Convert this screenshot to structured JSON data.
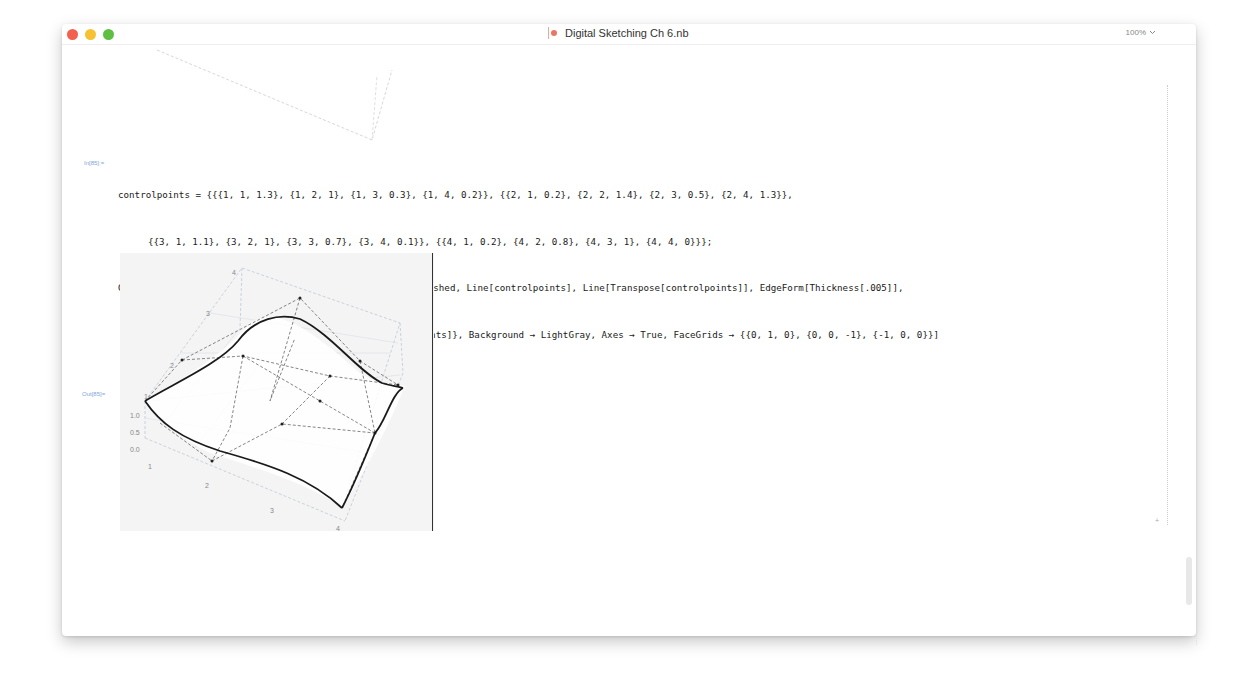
{
  "window": {
    "title": "Digital Sketching Ch 6.nb",
    "zoom_level": "100%",
    "traffic_lights": [
      "close",
      "minimize",
      "maximize"
    ],
    "colors": {
      "close": "#f3604f",
      "minimize": "#f6c232",
      "maximize": "#5fbf43",
      "cell_label": "#7fa6d6"
    }
  },
  "input_cell": {
    "label": "In[85]:=",
    "lines": [
      "controlpoints = {{{1, 1, 1.3}, {1, 2, 1}, {1, 3, 0.3}, {1, 4, 0.2}}, {{2, 1, 0.2}, {2, 2, 1.4}, {2, 3, 0.5}, {2, 4, 1.3}},",
      "{{3, 1, 1.1}, {3, 2, 1}, {3, 3, 0.7}, {3, 4, 0.1}}, {{4, 1, 0.2}, {4, 2, 0.8}, {4, 3, 1}, {4, 4, 0}}};",
      "Graphics3D[{PointSize[.01], Map[Point, controlpoints], Dashed, Line[controlpoints], Line[Transpose[controlpoints]], EdgeForm[Thickness[.005]],",
      "Glow[White], Opacity[.5], BSplineSurface[controlpoints]}, Background → LightGray, Axes → True, FaceGrids → {{0, 1, 0}, {0, 0, -1}, {-1, 0, 0}}]"
    ]
  },
  "output_cell": {
    "label": "Out[85]=",
    "plot": {
      "type": "Graphics3D BSplineSurface",
      "background": "#f4f4f4",
      "z_axis_ticks": [
        "1.0",
        "0.5",
        "0.0"
      ],
      "x_axis_ticks": [
        "1",
        "2",
        "3",
        "4"
      ],
      "y_axis_ticks": [
        "1",
        "2",
        "3",
        "4"
      ],
      "control_points": [
        [
          [
            1,
            1,
            1.3
          ],
          [
            1,
            2,
            1
          ],
          [
            1,
            3,
            0.3
          ],
          [
            1,
            4,
            0.2
          ]
        ],
        [
          [
            2,
            1,
            0.2
          ],
          [
            2,
            2,
            1.4
          ],
          [
            2,
            3,
            0.5
          ],
          [
            2,
            4,
            1.3
          ]
        ],
        [
          [
            3,
            1,
            1.1
          ],
          [
            3,
            2,
            1
          ],
          [
            3,
            3,
            0.7
          ],
          [
            3,
            4,
            0.1
          ]
        ],
        [
          [
            4,
            1,
            0.2
          ],
          [
            4,
            2,
            0.8
          ],
          [
            4,
            3,
            1
          ],
          [
            4,
            4,
            0
          ]
        ]
      ]
    }
  },
  "cell_insert_marker": "+"
}
